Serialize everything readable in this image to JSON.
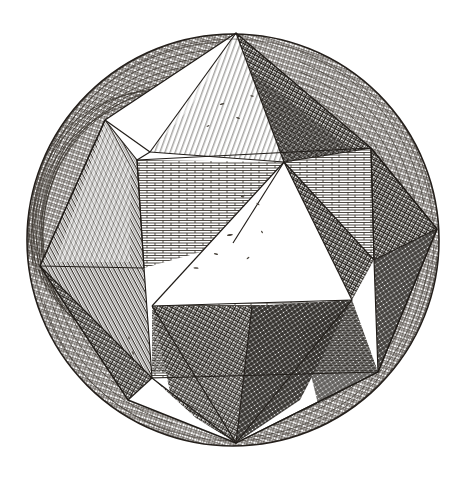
{
  "figure": {
    "kind": "engraving-illustration",
    "subject": "stellated polyhedron inscribed in a sphere",
    "style": "renaissance copperplate line engraving",
    "caption": "",
    "background_color": "#ffffff",
    "ink_color": "#2b2722",
    "paper_tone": "#fdfdfb"
  },
  "sphere": {
    "name": "circumscribed-sphere",
    "center_x": 233,
    "center_y": 240,
    "radius": 207,
    "outline_color": "#241f1b",
    "outline_width": 1.6,
    "latitude_band_count": 26,
    "band_color": "#3a332c"
  },
  "solid": {
    "name": "stellated-solid",
    "vertices": {
      "top_spike": [
        236,
        33
      ],
      "bottom_spike": [
        236,
        443
      ],
      "left_spike": [
        40,
        266
      ],
      "right_spike": [
        437,
        229
      ],
      "upper_left_spike": [
        105,
        120
      ],
      "hub_upper": [
        284,
        162
      ],
      "hub_center": [
        233,
        243
      ],
      "hub_lower_left": [
        155,
        278
      ],
      "hub_right": [
        363,
        252
      ],
      "cube_tl": [
        137,
        160
      ],
      "cube_tr": [
        371,
        148
      ],
      "cube_bl": [
        152,
        378
      ],
      "cube_br": [
        378,
        372
      ],
      "cube_mid_left": [
        144,
        268
      ],
      "cube_mid_right": [
        374,
        260
      ]
    },
    "face_count": 24,
    "spike_count": 6
  },
  "textures": [
    {
      "id": "brick",
      "label": "horizontal brick hatching",
      "tone": "light-mid",
      "color": "#2e2922"
    },
    {
      "id": "crosshatch",
      "label": "dense diagonal crosshatch",
      "tone": "dark",
      "color": "#231f1a"
    },
    {
      "id": "diagonal",
      "label": "single diagonal hatching",
      "tone": "mid",
      "color": "#2b2620"
    },
    {
      "id": "fine-line",
      "label": "fine parallel ruling",
      "tone": "light",
      "color": "#33302a"
    },
    {
      "id": "blank",
      "label": "unhatched highlight",
      "tone": "white",
      "color": "#ffffff"
    }
  ],
  "faces": [
    {
      "name": "face-top-highlight",
      "texture": "fine-line",
      "points": "236,33 284,162 150,152"
    },
    {
      "name": "face-top-right-dark",
      "texture": "crosshatch",
      "points": "236,33 284,162 371,148"
    },
    {
      "name": "face-upper-left-blank",
      "texture": "blank",
      "points": "105,120 150,152 137,160"
    },
    {
      "name": "face-upper-left-hatch",
      "texture": "diagonal",
      "points": "105,120 137,160 144,268 40,266"
    },
    {
      "name": "face-cube-left-brick",
      "texture": "brick",
      "points": "137,160 284,162 233,243 144,268"
    },
    {
      "name": "face-cube-right-brick",
      "texture": "brick",
      "points": "284,162 371,148 374,260 233,243"
    },
    {
      "name": "face-center-blank",
      "texture": "blank",
      "points": "284,162 233,243 155,278 233,243"
    },
    {
      "name": "face-center-highlight",
      "texture": "blank",
      "points": "284,162 155,300 363,300"
    },
    {
      "name": "face-right-dark",
      "texture": "crosshatch",
      "points": "284,162 374,260 363,300"
    },
    {
      "name": "face-right-spike-upper",
      "texture": "crosshatch",
      "points": "371,148 437,229 374,260"
    },
    {
      "name": "face-right-spike-lower",
      "texture": "crosshatch",
      "points": "437,229 374,260 378,372"
    },
    {
      "name": "face-left-spike-upper",
      "texture": "diagonal",
      "points": "40,266 144,268 152,378"
    },
    {
      "name": "face-left-spike-lower",
      "texture": "crosshatch",
      "points": "40,266 152,378 128,400"
    },
    {
      "name": "face-cube-bottom-brick",
      "texture": "brick",
      "points": "152,378 378,372 363,300 155,300"
    },
    {
      "name": "face-bottom-dark",
      "texture": "crosshatch",
      "points": "155,300 363,300 236,443"
    },
    {
      "name": "face-bottom-spike-left",
      "texture": "crosshatch",
      "points": "152,378 236,443 200,420"
    },
    {
      "name": "face-bottom-spike-right",
      "texture": "crosshatch",
      "points": "378,372 236,443 300,420"
    }
  ],
  "speckles": {
    "name": "foul-bite-speckles",
    "count": 14,
    "color": "#4a443c",
    "note": "small irregular flecks inside blank highlight triangles"
  }
}
